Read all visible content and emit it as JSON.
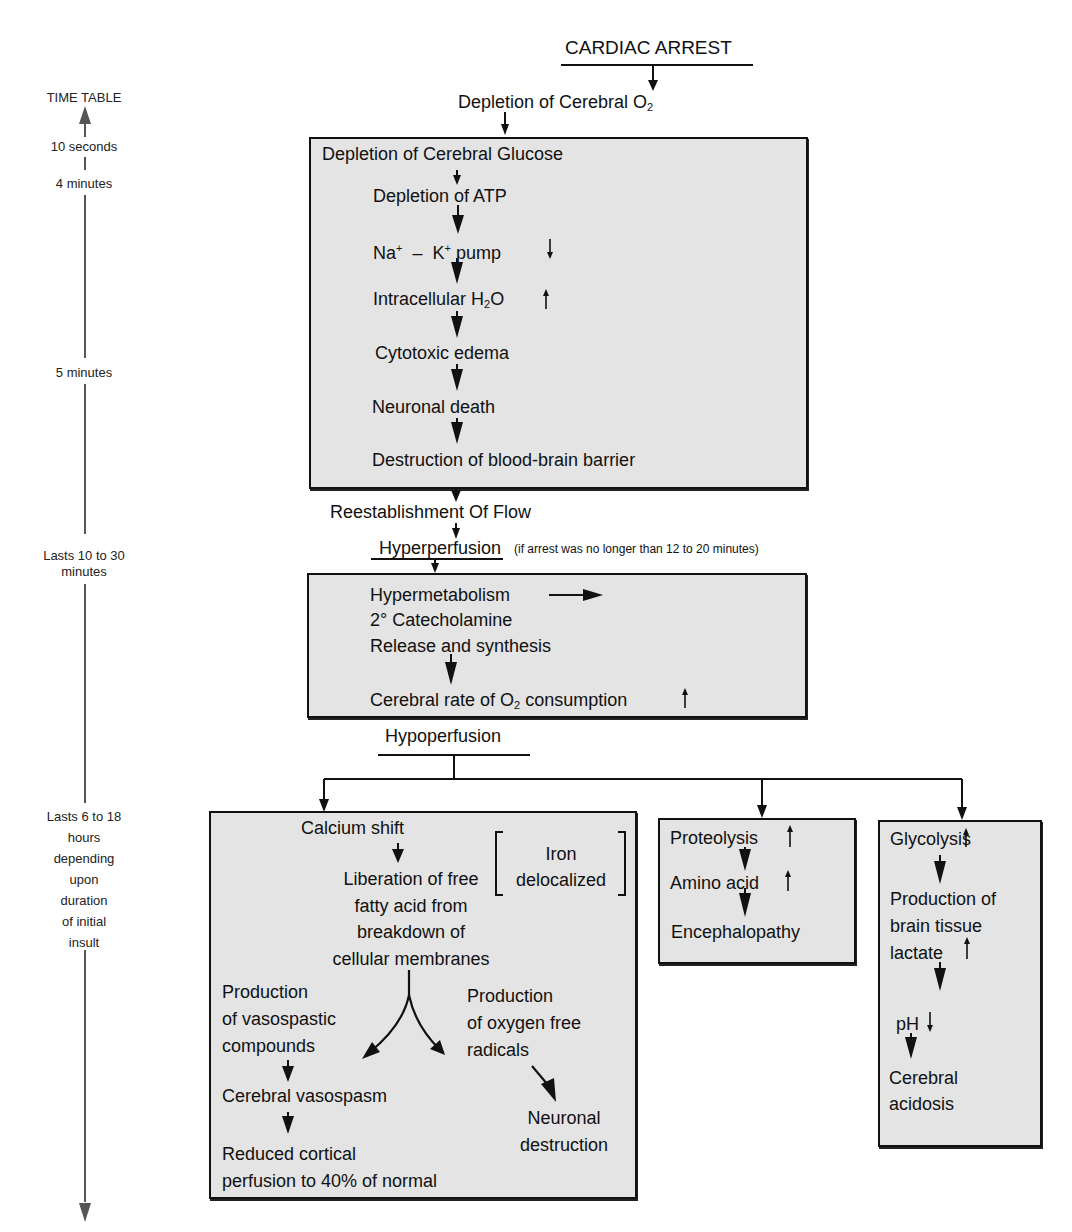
{
  "timeline": {
    "title": "TIME TABLE",
    "marks": [
      {
        "id": "t1",
        "label": "10 seconds"
      },
      {
        "id": "t2",
        "label": "4 minutes"
      },
      {
        "id": "t3",
        "label": "5 minutes"
      },
      {
        "id": "t4",
        "lines": [
          "Lasts 10 to 30",
          "minutes"
        ]
      },
      {
        "id": "t5",
        "lines": [
          "Lasts 6 to 18",
          "hours",
          "depending",
          "upon",
          "duration",
          "of initial",
          "insult"
        ]
      }
    ]
  },
  "flow": {
    "cardiac_arrest": "CARDIAC ARREST",
    "depletion_o2": {
      "text": "Depletion of Cerebral O",
      "sub": "2"
    },
    "ischemic_box": {
      "steps": [
        "Depletion of Cerebral Glucose",
        "Depletion of ATP",
        {
          "na": "Na",
          "plus": "+",
          "dash": "–",
          "k": "K",
          "plus2": "+",
          "pump": "pump",
          "indicator": "down"
        },
        {
          "text": "Intracellular H",
          "sub": "2",
          "after": "O",
          "indicator": "up"
        },
        "Cytotoxic edema",
        "Neuronal death",
        "Destruction of blood-brain barrier"
      ]
    },
    "reestablishment": "Reestablishment Of Flow",
    "hyperperfusion": {
      "label": "Hyperperfusion",
      "note": "(if arrest was no longer than 12 to 20 minutes)"
    },
    "hyper_box": {
      "line1": "Hypermetabolism",
      "line2": "2° Catecholamine",
      "line3": "Release and synthesis",
      "line4": {
        "text": "Cerebral rate of O",
        "sub": "2",
        "after": " consumption",
        "indicator": "up"
      }
    },
    "hypoperfusion": "Hypoperfusion",
    "calcium_box": {
      "calcium_shift": "Calcium shift",
      "liberation": [
        "Liberation of free",
        "fatty acid from",
        "breakdown of",
        "cellular membranes"
      ],
      "iron": [
        "Iron",
        "delocalized"
      ],
      "vasospastic": [
        "Production",
        "of vasospastic",
        "compounds"
      ],
      "oxygen_radicals": [
        "Production",
        "of oxygen free",
        "radicals"
      ],
      "vasospasm": "Cerebral vasospasm",
      "reduced": [
        "Reduced cortical",
        "perfusion to 40% of normal"
      ],
      "neuronal_destruction": [
        "Neuronal",
        "destruction"
      ]
    },
    "proteolysis_box": {
      "proteolysis": "Proteolysis",
      "amino": "Amino acid",
      "encephalopathy": "Encephalopathy"
    },
    "glycolysis_box": {
      "glycolysis": "Glycolysis",
      "production": [
        "Production of",
        "brain tissue",
        "lactate"
      ],
      "ph": "pH",
      "acidosis": [
        "Cerebral",
        "acidosis"
      ]
    }
  },
  "colors": {
    "box_fill": "#e4e4e4",
    "stroke": "#111111",
    "timeline": "#555555"
  }
}
